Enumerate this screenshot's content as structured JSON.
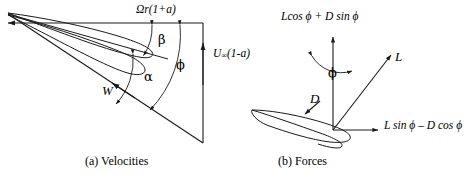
{
  "figure": {
    "background_color": "#ffffff",
    "stroke_color": "#1a1a1a",
    "panels": [
      {
        "id": "velocities",
        "caption": "(a) Velocities",
        "labels": {
          "tangential_velocity": "Ωr(1+a)",
          "axial_velocity_symbol": "U",
          "axial_velocity_subscript": "∞",
          "axial_velocity_rest": "(1-a)",
          "relative_velocity": "W",
          "twist_angle": "β",
          "angle_of_attack": "α",
          "inflow_angle": "ϕ"
        }
      },
      {
        "id": "forces",
        "caption": "(b) Forces",
        "labels": {
          "axial_force": "Lcos ϕ + D sin ϕ",
          "tangential_force": "L sin ϕ – D cos ϕ",
          "lift": "L",
          "drag": "D",
          "inflow_angle": "ϕ"
        }
      }
    ]
  }
}
